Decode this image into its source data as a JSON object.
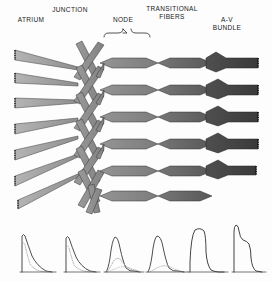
{
  "figure": {
    "background_color": "#fdfdfd",
    "ink_color": "#1a1a1a"
  },
  "labels": {
    "atrium": "ATRIUM",
    "junction": "JUNCTION",
    "node": "NODE",
    "transitional_fibers": "TRANSITIONAL\nFIBERS",
    "av_bundle": "A-V\nBUNDLE"
  },
  "regions": [
    {
      "key": "atrium",
      "name": "Atrium",
      "label": "ATRIUM",
      "fill": "#a8a8a8",
      "edge": "#4a4a4a",
      "x_start": 14,
      "x_end": 78,
      "fiber_count": 6,
      "fiber_shape": "tapered-band",
      "end_style": "serrated",
      "note": "Light grey wide atrial muscle bands tapering rightward"
    },
    {
      "key": "junction",
      "name": "Junction",
      "label": "JUNCTION",
      "fill": "#8f8f8f",
      "edge": "#3c3c3c",
      "x_start": 78,
      "x_end": 104,
      "fiber_count": 6,
      "fiber_shape": "interwoven-lattice",
      "end_style": "crossed-strands",
      "note": "Narrow crossing X-shaped interconnecting strands"
    },
    {
      "key": "node",
      "name": "Node",
      "label": "NODE",
      "fill": "#8a8a8a",
      "edge": "#3a3a3a",
      "x_start": 104,
      "x_end": 150,
      "fiber_count": 5,
      "fiber_shape": "hexagonal-mesh",
      "end_style": "mesh",
      "note": "Brace spans the nodal mesh region"
    },
    {
      "key": "transitional",
      "name": "Transitional fibers",
      "label": "TRANSITIONAL FIBERS",
      "fill": "#6d6d6d",
      "edge": "#303030",
      "x_start": 150,
      "x_end": 210,
      "fiber_count": 5,
      "fiber_shape": "hexagonal-mesh",
      "end_style": "mesh",
      "note": "Darker elongated diamond mesh converging rightward"
    },
    {
      "key": "av_bundle",
      "name": "A-V bundle",
      "label": "A-V BUNDLE",
      "fill": "#4a4a4a",
      "edge": "#242424",
      "x_start": 210,
      "x_end": 262,
      "fiber_count": 4,
      "fiber_shape": "thick-band",
      "end_style": "serrated",
      "note": "Dark thick parallel bundle fibers with serrated terminations"
    }
  ],
  "node_brace": {
    "name": "node-brace",
    "x_left": 104,
    "x_right": 150,
    "y": 34,
    "tick_y": 29,
    "style": "curly-brace-upward"
  },
  "action_potentials": {
    "caption": "Transmembrane action potentials recorded along the conduction pathway",
    "baseline_y": 272,
    "trace_color": "#3a3a3a",
    "dotted_color": "#9a9a9a",
    "traces": [
      {
        "index": 1,
        "name": "atrium-ap",
        "region": "atrium",
        "x_center": 33,
        "amplitude": 38,
        "upstroke": "fast",
        "shape": "spike-fast-decay",
        "has_dotted_overlay": true,
        "description": "Rapid upstroke, no plateau, rapid exponential repolarization"
      },
      {
        "index": 2,
        "name": "junction-ap",
        "region": "junction",
        "x_center": 77,
        "amplitude": 36,
        "upstroke": "fast",
        "shape": "spike-fast-decay",
        "has_dotted_overlay": true,
        "description": "Similar to atrial but slightly delayed and reduced"
      },
      {
        "index": 3,
        "name": "node-ap-upper",
        "region": "node",
        "x_center": 115,
        "amplitude": 36,
        "upstroke": "slow",
        "shape": "rounded-dome",
        "has_dotted_overlay": true,
        "description": "Slow upstroke, rounded dome, slow repolarization"
      },
      {
        "index": 4,
        "name": "node-ap-lower",
        "region": "node",
        "x_center": 156,
        "amplitude": 36,
        "upstroke": "slow",
        "shape": "rounded-dome",
        "has_dotted_overlay": true,
        "description": "Broad rounded nodal action potential"
      },
      {
        "index": 5,
        "name": "transitional-ap",
        "region": "transitional",
        "x_center": 199,
        "amplitude": 46,
        "upstroke": "moderate",
        "shape": "plateau",
        "has_dotted_overlay": false,
        "description": "Taller with developing plateau phase"
      },
      {
        "index": 6,
        "name": "av-bundle-ap",
        "region": "av_bundle",
        "x_center": 243,
        "amplitude": 52,
        "upstroke": "very-fast",
        "shape": "spike-notch-plateau",
        "has_dotted_overlay": false,
        "description": "Rapid spike with notch and long plateau, Purkinje-type"
      }
    ]
  }
}
